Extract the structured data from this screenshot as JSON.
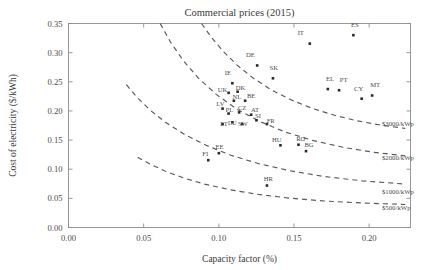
{
  "chart_data": {
    "type": "scatter",
    "title": "Commercial prices (2015)",
    "xlabel": "Capacity factor (%)",
    "ylabel": "Cost of electricity ($/kWh)",
    "xlim": [
      0.0,
      0.2275
    ],
    "ylim": [
      0.0,
      0.35
    ],
    "xticks": [
      0.0,
      0.05,
      0.1,
      0.15,
      0.2
    ],
    "xticklabels": [
      "0.00",
      "0.05",
      "0.10",
      "0.15",
      "0.20"
    ],
    "yticks": [
      0.0,
      0.05,
      0.1,
      0.15,
      0.2,
      0.25,
      0.3,
      0.35
    ],
    "yticklabels": [
      "0.00",
      "0.05",
      "0.10",
      "0.15",
      "0.20",
      "0.25",
      "0.30",
      "0.35"
    ],
    "grid": false,
    "legend_position": "inline-curve-labels",
    "marker_color": "#2b2b2b",
    "curve_color": "#5a5a5a",
    "points": [
      {
        "label": "IT",
        "x": 0.1605,
        "y": 0.3155,
        "lx": 0.1545,
        "ly": 0.33
      },
      {
        "label": "ES",
        "x": 0.1895,
        "y": 0.33,
        "lx": 0.1905,
        "ly": 0.344
      },
      {
        "label": "DE",
        "x": 0.1255,
        "y": 0.278,
        "lx": 0.121,
        "ly": 0.2925
      },
      {
        "label": "SK",
        "x": 0.136,
        "y": 0.256,
        "lx": 0.1365,
        "ly": 0.27
      },
      {
        "label": "IE",
        "x": 0.109,
        "y": 0.2475,
        "lx": 0.106,
        "ly": 0.2615
      },
      {
        "label": "EL",
        "x": 0.1725,
        "y": 0.2375,
        "lx": 0.174,
        "ly": 0.251
      },
      {
        "label": "PT",
        "x": 0.18,
        "y": 0.2355,
        "lx": 0.183,
        "ly": 0.25
      },
      {
        "label": "MT",
        "x": 0.202,
        "y": 0.2265,
        "lx": 0.204,
        "ly": 0.2415
      },
      {
        "label": "CY",
        "x": 0.195,
        "y": 0.221,
        "lx": 0.193,
        "ly": 0.235
      },
      {
        "label": "UK",
        "x": 0.1065,
        "y": 0.231,
        "lx": 0.1025,
        "ly": 0.233
      },
      {
        "label": "DK",
        "x": 0.1125,
        "y": 0.233,
        "lx": 0.1145,
        "ly": 0.2355
      },
      {
        "label": "NL",
        "x": 0.11,
        "y": 0.2175,
        "lx": 0.112,
        "ly": 0.2205
      },
      {
        "label": "BE",
        "x": 0.1175,
        "y": 0.2175,
        "lx": 0.1215,
        "ly": 0.2215
      },
      {
        "label": "LV",
        "x": 0.1025,
        "y": 0.204,
        "lx": 0.101,
        "ly": 0.209
      },
      {
        "label": "PL",
        "x": 0.1065,
        "y": 0.1955,
        "lx": 0.107,
        "ly": 0.199
      },
      {
        "label": "CZ",
        "x": 0.1135,
        "y": 0.1975,
        "lx": 0.1155,
        "ly": 0.201
      },
      {
        "label": "AT",
        "x": 0.1215,
        "y": 0.1935,
        "lx": 0.124,
        "ly": 0.1975
      },
      {
        "label": "LT",
        "x": 0.1025,
        "y": 0.1775,
        "lx": 0.1035,
        "ly": 0.175
      },
      {
        "label": "LU",
        "x": 0.109,
        "y": 0.1805,
        "lx": 0.109,
        "ly": 0.176
      },
      {
        "label": "SW",
        "x": 0.1155,
        "y": 0.1775,
        "lx": 0.116,
        "ly": 0.1745
      },
      {
        "label": "SI",
        "x": 0.125,
        "y": 0.184,
        "lx": 0.126,
        "ly": 0.188
      },
      {
        "label": "FR",
        "x": 0.132,
        "y": 0.1775,
        "lx": 0.1345,
        "ly": 0.179
      },
      {
        "label": "HU",
        "x": 0.141,
        "y": 0.141,
        "lx": 0.1385,
        "ly": 0.1465
      },
      {
        "label": "RO",
        "x": 0.153,
        "y": 0.142,
        "lx": 0.1545,
        "ly": 0.148
      },
      {
        "label": "BG",
        "x": 0.158,
        "y": 0.131,
        "lx": 0.16,
        "ly": 0.1375
      },
      {
        "label": "EE",
        "x": 0.1,
        "y": 0.1275,
        "lx": 0.1005,
        "ly": 0.1345
      },
      {
        "label": "FI",
        "x": 0.093,
        "y": 0.1155,
        "lx": 0.091,
        "ly": 0.1225
      },
      {
        "label": "HR",
        "x": 0.132,
        "y": 0.072,
        "lx": 0.133,
        "ly": 0.0795
      }
    ],
    "curves": [
      {
        "label": "$3000/kWp",
        "label_x": 0.2085,
        "label_y": 0.178,
        "path": [
          [
            0.0885,
            0.35
          ],
          [
            0.095,
            0.3265
          ],
          [
            0.103,
            0.302
          ],
          [
            0.112,
            0.279
          ],
          [
            0.123,
            0.256
          ],
          [
            0.135,
            0.236
          ],
          [
            0.148,
            0.219
          ],
          [
            0.162,
            0.2045
          ],
          [
            0.177,
            0.1925
          ],
          [
            0.192,
            0.183
          ],
          [
            0.208,
            0.1755
          ],
          [
            0.224,
            0.17
          ]
        ]
      },
      {
        "label": "$2000/kWp",
        "label_x": 0.2085,
        "label_y": 0.119,
        "path": [
          [
            0.061,
            0.35
          ],
          [
            0.068,
            0.3175
          ],
          [
            0.0765,
            0.286
          ],
          [
            0.0865,
            0.256
          ],
          [
            0.0985,
            0.228
          ],
          [
            0.112,
            0.203
          ],
          [
            0.1275,
            0.1815
          ],
          [
            0.1445,
            0.1635
          ],
          [
            0.163,
            0.149
          ],
          [
            0.183,
            0.1375
          ],
          [
            0.203,
            0.129
          ],
          [
            0.224,
            0.123
          ]
        ]
      },
      {
        "label": "$1000/kWp",
        "label_x": 0.2085,
        "label_y": 0.061,
        "path": [
          [
            0.0385,
            0.245
          ],
          [
            0.0455,
            0.2235
          ],
          [
            0.054,
            0.202
          ],
          [
            0.0645,
            0.1805
          ],
          [
            0.077,
            0.16
          ],
          [
            0.0915,
            0.141
          ],
          [
            0.108,
            0.124
          ],
          [
            0.1265,
            0.1095
          ],
          [
            0.147,
            0.0975
          ],
          [
            0.17,
            0.0875
          ],
          [
            0.1955,
            0.08
          ],
          [
            0.224,
            0.0745
          ]
        ]
      },
      {
        "label": "$500/kWp",
        "label_x": 0.2085,
        "label_y": 0.034,
        "path": [
          [
            0.046,
            0.1205
          ],
          [
            0.0545,
            0.1085
          ],
          [
            0.0645,
            0.0965
          ],
          [
            0.0765,
            0.085
          ],
          [
            0.0905,
            0.0745
          ],
          [
            0.107,
            0.065
          ],
          [
            0.1255,
            0.057
          ],
          [
            0.1465,
            0.0505
          ],
          [
            0.17,
            0.0455
          ],
          [
            0.1955,
            0.042
          ],
          [
            0.224,
            0.0395
          ]
        ]
      }
    ]
  }
}
